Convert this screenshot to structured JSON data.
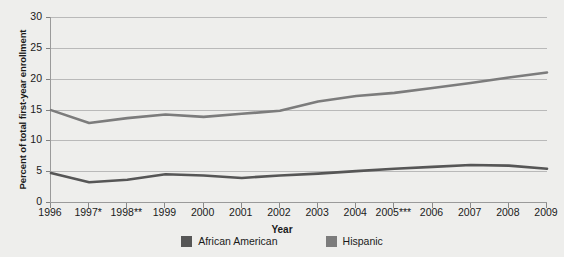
{
  "chart_data": {
    "type": "line",
    "title": "",
    "xlabel": "Year",
    "ylabel": "Percent of total first-year enrollment",
    "categories": [
      "1996",
      "1997*",
      "1998**",
      "1999",
      "2000",
      "2001",
      "2002",
      "2003",
      "2004",
      "2005***",
      "2006",
      "2007",
      "2008",
      "2009"
    ],
    "x": [
      1996,
      1997,
      1998,
      1999,
      2000,
      2001,
      2002,
      2003,
      2004,
      2005,
      2006,
      2007,
      2008,
      2009
    ],
    "ylim": [
      0,
      30
    ],
    "yticks": [
      0,
      5,
      10,
      15,
      20,
      25,
      30
    ],
    "grid": true,
    "legend_position": "bottom",
    "series": [
      {
        "name": "African American",
        "color": "#565656",
        "values": [
          4.7,
          3.2,
          3.6,
          4.5,
          4.3,
          3.9,
          4.3,
          4.6,
          5.0,
          5.4,
          5.7,
          6.0,
          5.9,
          5.4
        ]
      },
      {
        "name": "Hispanic",
        "color": "#7c7c7c",
        "values": [
          14.9,
          12.8,
          13.6,
          14.2,
          13.8,
          14.3,
          14.8,
          16.3,
          17.2,
          17.7,
          18.5,
          19.3,
          20.2,
          21.0
        ]
      }
    ]
  },
  "legend": {
    "items": [
      {
        "label": "African American",
        "color": "#565656"
      },
      {
        "label": "Hispanic",
        "color": "#7c7c7c"
      }
    ]
  }
}
